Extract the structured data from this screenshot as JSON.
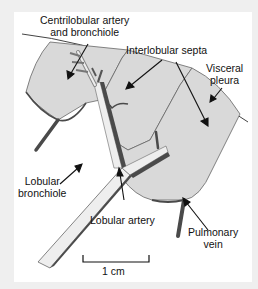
{
  "figure": {
    "labels": {
      "centrilobular_line1": "Centrilobular artery",
      "centrilobular_line2": "and bronchiole",
      "interlobular_septa": "Interlobular septa",
      "visceral_pleura_line1": "Visceral",
      "visceral_pleura_line2": "pleura",
      "lobular_bronchiole_line1": "Lobular",
      "lobular_bronchiole_line2": "bronchiole",
      "lobular_artery": "Lobular artery",
      "pulmonary_vein_line1": "Pulmonary",
      "pulmonary_vein_line2": "vein"
    },
    "scale_bar": {
      "label": "1 cm"
    },
    "colors": {
      "background": "#efefef",
      "panel": "#ffffff",
      "lobule_fill": "#d9d9d9",
      "septa_stroke": "#555555",
      "vessel_dark": "#4a4a4a",
      "bronchus_light": "#eeeeee",
      "text": "#111111"
    }
  }
}
